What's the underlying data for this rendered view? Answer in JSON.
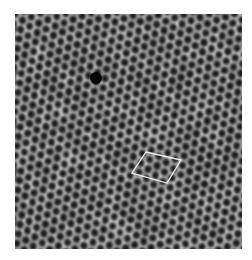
{
  "figure": {
    "type": "microscopy-image",
    "background_color": "#ffffff",
    "frame": {
      "x": 15,
      "y": 14,
      "width": 227,
      "height": 235
    },
    "lattice": {
      "spacing": 9.6,
      "angle_deg": -20,
      "pit_color": "#151515",
      "network_color": "#d8d8d8",
      "mid_color": "#6e6e6e"
    },
    "bright_spots": [
      {
        "x": 70,
        "y": 160,
        "r": 9
      },
      {
        "x": 150,
        "y": 135,
        "r": 7
      },
      {
        "x": 200,
        "y": 110,
        "r": 6
      },
      {
        "x": 120,
        "y": 230,
        "r": 7
      },
      {
        "x": 40,
        "y": 50,
        "r": 6
      },
      {
        "x": 170,
        "y": 60,
        "r": 6
      },
      {
        "x": 60,
        "y": 110,
        "r": 5
      },
      {
        "x": 210,
        "y": 200,
        "r": 6
      }
    ],
    "defect": {
      "x": 96,
      "y": 78,
      "r": 6,
      "color": "#050505"
    },
    "annotation": {
      "shape": "rhombus",
      "label": "unit-cell",
      "stroke": "#f0f0f0",
      "stroke_width": 1.3,
      "points": [
        [
          146,
          152
        ],
        [
          181,
          160
        ],
        [
          167,
          183
        ],
        [
          132,
          173
        ]
      ]
    }
  }
}
